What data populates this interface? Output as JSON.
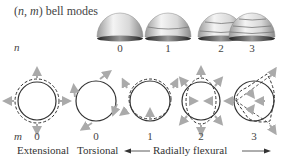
{
  "title": {
    "open": "(",
    "n": "n",
    "sep": ", ",
    "m": "m",
    "close": ")",
    "rest": " bell modes"
  },
  "row_labels": {
    "n": "n",
    "m": "m"
  },
  "bells": [
    {
      "n": "0",
      "rings": 0
    },
    {
      "n": "1",
      "rings": 1
    },
    {
      "n": "2",
      "rings": 2
    },
    {
      "n": "3",
      "rings": 3
    }
  ],
  "circles": [
    {
      "m": "0",
      "type": "extensional"
    },
    {
      "m": "0",
      "type": "torsional"
    },
    {
      "m": "1",
      "type": "flexural-1"
    },
    {
      "m": "2",
      "type": "flexural-2"
    },
    {
      "m": "3",
      "type": "flexural-3"
    }
  ],
  "categories": {
    "extensional": "Extensional",
    "torsional": "Torsional",
    "radially_flexural": "Radially flexural"
  },
  "colors": {
    "line": "#333333",
    "arrow": "#aaaaaa",
    "bell_light": "#f2f2f2",
    "bell_dark": "#777777"
  }
}
